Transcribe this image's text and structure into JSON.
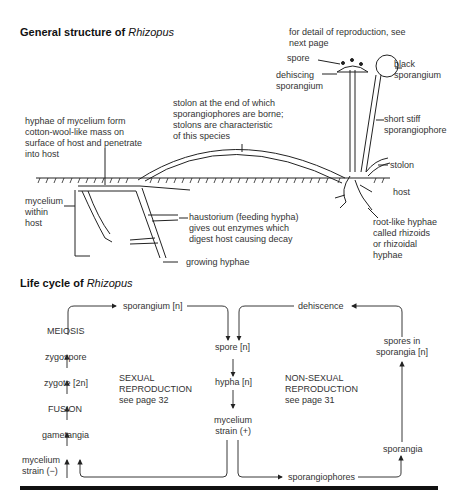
{
  "structure": {
    "title_prefix": "General structure of ",
    "title_italic": "Rhizopus",
    "labels": {
      "reproduction_note": "for detail of reproduction, see\nnext page",
      "spore": "spore",
      "dehiscing_sporangium": "dehiscing\nsporangium",
      "black_sporangium": "black\nsporangium",
      "stolon_note": "stolon at the end of which\nsporangiophores are borne;\nstolons are characteristic\nof this species",
      "hyphae_note": "hyphae of mycelium form\ncotton-wool-like mass on\nsurface of host and penetrate\ninto host",
      "short_stiff": "short stiff\nsporangiophore",
      "stolon": "stolon",
      "host": "host",
      "mycelium_within": "mycelium\nwithin\nhost",
      "haustorium": "haustorium (feeding hypha)\ngives out enzymes which\ndigest host causing decay",
      "rhizoids": "root-like hyphae\ncalled rhizoids\nor rhizoidal\nhyphae",
      "growing_hyphae": "growing hyphae"
    }
  },
  "lifecycle": {
    "title_prefix": "Life cycle of ",
    "title_italic": "Rhizopus",
    "nodes": {
      "sporangium_n": "sporangium [n]",
      "meiosis": "MEIOSIS",
      "zygospore": "zygospore",
      "zygote": "zygote [2n]",
      "fusion": "FUSION",
      "gametangia": "gametangia",
      "mycelium_minus": "mycelium\nstrain (−)",
      "sexual": "SEXUAL\nREPRODUCTION\nsee page 32",
      "spore_n": "spore [n]",
      "hypha_n": "hypha [n]",
      "mycelium_plus": "mycelium\nstrain (+)",
      "nonsexual": "NON-SEXUAL\nREPRODUCTION\nsee page 31",
      "dehiscence": "dehiscence",
      "spores_in_sporangia": "spores in\nsporangia [n]",
      "sporangia": "sporangia",
      "sporangiophores": "sporangiophores"
    }
  }
}
